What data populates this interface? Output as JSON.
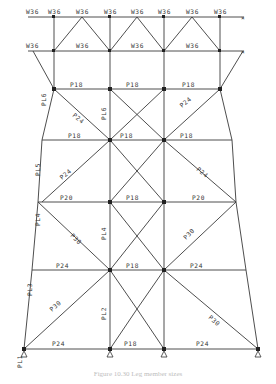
{
  "diagram": {
    "type": "structural-truss-leg-elevation",
    "top_chord_labels": [
      "W36",
      "W36",
      "W36",
      "W36",
      "W36",
      "W36",
      "W36",
      "W36"
    ],
    "second_chord_labels": [
      "W36",
      "W36",
      "W36",
      "W36",
      "W36",
      "W36",
      "W36",
      "W36"
    ],
    "head_diagonal_labels": [
      "D20",
      "D20",
      "D20",
      "D20",
      "D20",
      "D20"
    ],
    "head_vertical_labels": [
      "T48",
      "T48",
      "T48",
      "T48"
    ],
    "head_brace_labels": [
      "P30",
      "P30"
    ],
    "level1": {
      "horizontals": [
        "P18",
        "P18",
        "P18"
      ],
      "verticals": [
        "T48",
        "T48",
        "T48",
        "T48"
      ],
      "tags": [
        "8M",
        "8M",
        "8M",
        "8M"
      ]
    },
    "level2": {
      "horizontals": [
        "P18",
        "P18",
        "P18"
      ],
      "diagonals": [
        "P24",
        "P18",
        "P24",
        "P18"
      ]
    },
    "level3": {
      "horizontals": [
        "P20",
        "P18",
        "P20"
      ],
      "diagonals": [
        "P24",
        "P18",
        "P18",
        "P24"
      ]
    },
    "level4": {
      "horizontals": [
        "P24",
        "P18",
        "P24"
      ],
      "diagonals": [
        "P30",
        "P18",
        "P18",
        "P30"
      ]
    },
    "base": {
      "horizontals": [
        "P24",
        "P18",
        "P24"
      ],
      "diagonals": [
        "P30",
        "P24",
        "P24",
        "P30"
      ]
    },
    "leg_labels": {
      "outer": [
        "PL6",
        "PL5",
        "PL4",
        "PL3",
        "PL2",
        "PL1"
      ],
      "inner": [
        "PL6",
        "PL5",
        "PL4",
        "PL3",
        "PL2",
        "PL1"
      ]
    },
    "tag": "8M",
    "caption": "Figure 10.30 Leg member sizes"
  }
}
